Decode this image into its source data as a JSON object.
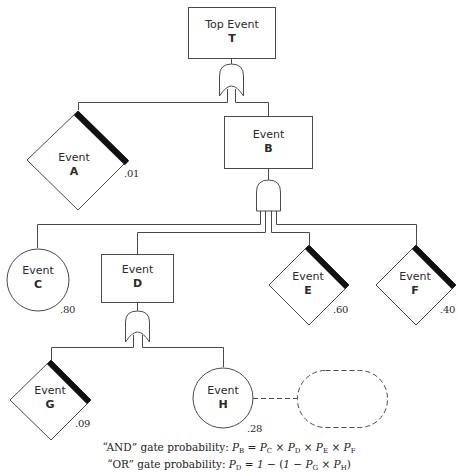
{
  "diagram": {
    "type": "fault-tree",
    "line_color": "#4a4a4a",
    "emphasis_color": "#111111",
    "nodes": {
      "T": {
        "word": "Top Event",
        "letter": "T",
        "shape": "rectangle"
      },
      "A": {
        "word": "Event",
        "letter": "A",
        "shape": "diamond",
        "probability": ".01"
      },
      "B": {
        "word": "Event",
        "letter": "B",
        "shape": "rectangle"
      },
      "C": {
        "word": "Event",
        "letter": "C",
        "shape": "circle",
        "probability": ".80"
      },
      "D": {
        "word": "Event",
        "letter": "D",
        "shape": "rectangle"
      },
      "E": {
        "word": "Event",
        "letter": "E",
        "shape": "diamond",
        "probability": ".60"
      },
      "F": {
        "word": "Event",
        "letter": "F",
        "shape": "diamond",
        "probability": ".40"
      },
      "G": {
        "word": "Event",
        "letter": "G",
        "shape": "diamond",
        "probability": ".09"
      },
      "H": {
        "word": "Event",
        "letter": "H",
        "shape": "circle",
        "probability": ".28"
      }
    },
    "gates": [
      {
        "id": "gate-T",
        "type": "OR",
        "output": "T",
        "inputs": [
          "A",
          "B"
        ]
      },
      {
        "id": "gate-B",
        "type": "AND",
        "output": "B",
        "inputs": [
          "C",
          "D",
          "E",
          "F"
        ]
      },
      {
        "id": "gate-D",
        "type": "OR",
        "output": "D",
        "inputs": [
          "G",
          "H"
        ]
      }
    ],
    "extra": {
      "dashed_placeholder_linked_to": "H"
    }
  },
  "formulas": {
    "and": {
      "prefix": "“AND” gate probability: ",
      "lhs": "P",
      "lhs_sub": "B",
      "eq": " = ",
      "t1": "P",
      "t1_sub": "C",
      "x1": " × ",
      "t2": "P",
      "t2_sub": "D",
      "x2": " × ",
      "t3": "P",
      "t3_sub": "E",
      "x3": " × ",
      "t4": "P",
      "t4_sub": "F"
    },
    "or": {
      "prefix": "“OR” gate probability: ",
      "lhs": "P",
      "lhs_sub": "D",
      "eq": " = ",
      "one": "1",
      "minus1": " − (",
      "one2": "1",
      "minus2": " − ",
      "t1": "P",
      "t1_sub": "G",
      "x1": " × ",
      "t2": "P",
      "t2_sub": "H",
      "close": ")"
    }
  }
}
